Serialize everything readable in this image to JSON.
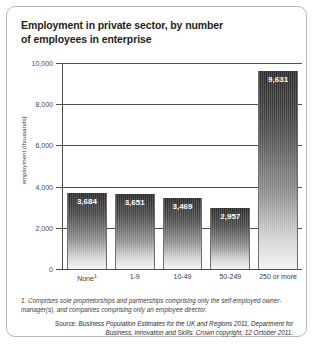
{
  "card": {
    "title_line1": "Employment in private sector, by number",
    "title_line2": "of employees in enterprise"
  },
  "chart_data": {
    "type": "bar",
    "title": "Employment in private sector, by number of employees in enterprise",
    "xlabel": "",
    "ylabel": "employment (thousands)",
    "ylim": [
      0,
      10000
    ],
    "yticks": [
      "0",
      "2,000",
      "4,000",
      "6,000",
      "8,000",
      "10,000"
    ],
    "ytick_values": [
      0,
      2000,
      4000,
      6000,
      8000,
      10000
    ],
    "grid": true,
    "legend": "none",
    "categories": [
      "None¹",
      "1-9",
      "10-49",
      "50-249",
      "250 or more"
    ],
    "category_plain": [
      "None",
      "1-9",
      "10-49",
      "50-249",
      "250 or more"
    ],
    "values": [
      3684,
      3651,
      3469,
      2957,
      9631
    ],
    "value_labels": [
      "3,684",
      "3,651",
      "3,469",
      "2,957",
      "9,631"
    ]
  },
  "notes": {
    "footnote": "1. Comprises sole proprietorships and partnerships comprising only the self-employed owner-manager(s), and companies comprising only an employee director.",
    "source_prefix": "Source:",
    "source_text": "Business Population Estimates for the UK and Regions 2011, Department for Business, Innovation and Skills. Crown copyright, 12 October 2011."
  }
}
